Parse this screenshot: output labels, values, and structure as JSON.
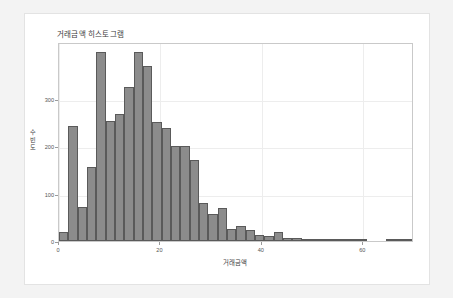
{
  "figure": {
    "background_color": "#f3f3f3",
    "card_color": "#ffffff",
    "bar_fill_color": "#8c8c8c",
    "bar_edge_color": "#5a5a5a",
    "grid_color": "#ededed"
  },
  "chart_data": {
    "type": "bar",
    "title": "거래금액 히스토그램",
    "xlabel": "거래금액",
    "ylabel": "빈도수",
    "ylabel_chars": [
      "수",
      "빈",
      "도"
    ],
    "xlim": [
      0,
      70
    ],
    "ylim": [
      0,
      420
    ],
    "xticks": [
      0,
      20,
      40,
      60
    ],
    "xtick_labels": [
      "0",
      "20",
      "40",
      "60"
    ],
    "yticks": [
      0,
      100,
      200,
      300
    ],
    "ytick_labels": [
      "0",
      "100",
      "200",
      "300"
    ],
    "grid": true,
    "legend": null,
    "bin_width": 1.84,
    "bin_starts": [
      0.0,
      1.84,
      3.68,
      5.52,
      7.36,
      9.2,
      11.05,
      12.89,
      14.73,
      16.57,
      18.41,
      20.25,
      22.09,
      23.93,
      25.78,
      27.62,
      29.46,
      31.3,
      33.14,
      34.98,
      36.82,
      38.67,
      40.51,
      42.35,
      44.19,
      46.03,
      47.87,
      49.71,
      51.55,
      53.4,
      55.24,
      57.08,
      58.92,
      60.76,
      62.6,
      64.44,
      66.29,
      68.13
    ],
    "categories": [
      "0.9",
      "2.8",
      "4.6",
      "6.4",
      "8.3",
      "10.1",
      "12.0",
      "13.8",
      "15.6",
      "17.5",
      "19.3",
      "21.2",
      "23.0",
      "24.9",
      "26.7",
      "28.5",
      "30.4",
      "32.2",
      "34.1",
      "35.9",
      "37.7",
      "39.6",
      "41.4",
      "43.3",
      "45.1",
      "46.9",
      "48.8",
      "50.6",
      "52.5",
      "54.3",
      "56.2",
      "58.0",
      "59.8",
      "61.7",
      "63.5",
      "65.4",
      "67.2",
      "69.1"
    ],
    "values": [
      18,
      242,
      72,
      157,
      398,
      253,
      268,
      325,
      398,
      370,
      251,
      239,
      200,
      200,
      170,
      81,
      57,
      70,
      26,
      32,
      24,
      12,
      10,
      18,
      7,
      6,
      5,
      4,
      2,
      2,
      1,
      1,
      1,
      0,
      0,
      1,
      1,
      1
    ]
  }
}
